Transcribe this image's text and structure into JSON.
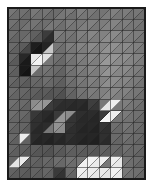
{
  "figure": {
    "type": "triangulated-grid-image",
    "background_color": "#ffffff",
    "grid_line_color": "#262626",
    "border_color": "#1a1a1a"
  },
  "chart_data": {
    "type": "heatmap",
    "subtitle": "",
    "xlabel": "",
    "ylabel": "",
    "grid": true,
    "legend": null,
    "colormap": "gray",
    "value_range": [
      0,
      255
    ],
    "layout": {
      "origin_x": 8,
      "origin_y": 8,
      "cell_width": 11.42,
      "cell_height": 11.4,
      "columns": 12,
      "rows": 15,
      "split": "anti-diagonal (bottom-left to top-right)",
      "triangles_per_cell": 2,
      "triangle_order": [
        "upper-left",
        "lower-right"
      ]
    },
    "note": "Each grid cell is bisected by a diagonal from its bottom-left corner to its top-right corner, producing an upper-left triangle and a lower-right triangle. Values below are 0-255 grayscale intensities, listed row by row (top to bottom), each cell as [upper_left, lower_right].",
    "cells": [
      [
        [
          118,
          108
        ],
        [
          112,
          104
        ],
        [
          120,
          112
        ],
        [
          116,
          106
        ],
        [
          108,
          118
        ],
        [
          122,
          110
        ],
        [
          126,
          118
        ],
        [
          120,
          112
        ],
        [
          116,
          124
        ],
        [
          128,
          118
        ],
        [
          124,
          114
        ],
        [
          118,
          110
        ]
      ],
      [
        [
          114,
          104
        ],
        [
          108,
          116
        ],
        [
          116,
          108
        ],
        [
          110,
          120
        ],
        [
          118,
          110
        ],
        [
          124,
          116
        ],
        [
          120,
          126
        ],
        [
          128,
          118
        ],
        [
          124,
          130
        ],
        [
          132,
          122
        ],
        [
          126,
          118
        ],
        [
          120,
          112
        ]
      ],
      [
        [
          110,
          100
        ],
        [
          104,
          112
        ],
        [
          96,
          86
        ],
        [
          60,
          44
        ],
        [
          126,
          116
        ],
        [
          120,
          112
        ],
        [
          128,
          120
        ],
        [
          134,
          124
        ],
        [
          130,
          140
        ],
        [
          138,
          128
        ],
        [
          132,
          124
        ],
        [
          124,
          116
        ]
      ],
      [
        [
          106,
          96
        ],
        [
          92,
          70
        ],
        [
          30,
          22
        ],
        [
          36,
          200
        ],
        [
          118,
          110
        ],
        [
          126,
          118
        ],
        [
          132,
          124
        ],
        [
          138,
          128
        ],
        [
          134,
          146
        ],
        [
          144,
          134
        ],
        [
          138,
          130
        ],
        [
          128,
          120
        ]
      ],
      [
        [
          102,
          90
        ],
        [
          40,
          26
        ],
        [
          232,
          244
        ],
        [
          226,
          118
        ],
        [
          112,
          104
        ],
        [
          122,
          114
        ],
        [
          128,
          122
        ],
        [
          136,
          126
        ],
        [
          140,
          152
        ],
        [
          148,
          138
        ],
        [
          142,
          132
        ],
        [
          130,
          122
        ]
      ],
      [
        [
          100,
          94
        ],
        [
          26,
          20
        ],
        [
          200,
          108
        ],
        [
          116,
          110
        ],
        [
          106,
          98
        ],
        [
          118,
          112
        ],
        [
          126,
          118
        ],
        [
          132,
          124
        ],
        [
          136,
          148
        ],
        [
          144,
          134
        ],
        [
          138,
          128
        ],
        [
          126,
          118
        ]
      ],
      [
        [
          104,
          96
        ],
        [
          98,
          90
        ],
        [
          104,
          100
        ],
        [
          110,
          104
        ],
        [
          100,
          94
        ],
        [
          114,
          108
        ],
        [
          122,
          116
        ],
        [
          128,
          120
        ],
        [
          132,
          142
        ],
        [
          140,
          130
        ],
        [
          134,
          124
        ],
        [
          122,
          114
        ]
      ],
      [
        [
          108,
          100
        ],
        [
          102,
          96
        ],
        [
          96,
          88
        ],
        [
          92,
          84
        ],
        [
          88,
          80
        ],
        [
          104,
          98
        ],
        [
          116,
          110
        ],
        [
          124,
          118
        ],
        [
          128,
          136
        ],
        [
          136,
          126
        ],
        [
          130,
          120
        ],
        [
          118,
          110
        ]
      ],
      [
        [
          112,
          104
        ],
        [
          106,
          98
        ],
        [
          140,
          150
        ],
        [
          150,
          60
        ],
        [
          52,
          44
        ],
        [
          46,
          40
        ],
        [
          44,
          38
        ],
        [
          62,
          54
        ],
        [
          120,
          230
        ],
        [
          238,
          120
        ],
        [
          126,
          118
        ],
        [
          116,
          108
        ]
      ],
      [
        [
          110,
          102
        ],
        [
          104,
          96
        ],
        [
          56,
          48
        ],
        [
          42,
          36
        ],
        [
          58,
          150
        ],
        [
          140,
          52
        ],
        [
          46,
          40
        ],
        [
          44,
          38
        ],
        [
          60,
          244
        ],
        [
          236,
          116
        ],
        [
          122,
          114
        ],
        [
          112,
          104
        ]
      ],
      [
        [
          106,
          98
        ],
        [
          100,
          92
        ],
        [
          48,
          40
        ],
        [
          44,
          120
        ],
        [
          146,
          140
        ],
        [
          54,
          46
        ],
        [
          42,
          36
        ],
        [
          40,
          34
        ],
        [
          52,
          46
        ],
        [
          110,
          104
        ],
        [
          118,
          110
        ],
        [
          110,
          102
        ]
      ],
      [
        [
          104,
          96
        ],
        [
          236,
          98
        ],
        [
          44,
          36
        ],
        [
          40,
          34
        ],
        [
          44,
          38
        ],
        [
          48,
          42
        ],
        [
          40,
          34
        ],
        [
          38,
          32
        ],
        [
          48,
          42
        ],
        [
          106,
          100
        ],
        [
          114,
          106
        ],
        [
          108,
          100
        ]
      ],
      [
        [
          102,
          94
        ],
        [
          96,
          90
        ],
        [
          92,
          86
        ],
        [
          88,
          82
        ],
        [
          94,
          88
        ],
        [
          100,
          94
        ],
        [
          96,
          90
        ],
        [
          92,
          86
        ],
        [
          98,
          92
        ],
        [
          104,
          98
        ],
        [
          112,
          104
        ],
        [
          106,
          98
        ]
      ],
      [
        [
          100,
          228
        ],
        [
          236,
          96
        ],
        [
          100,
          94
        ],
        [
          104,
          98
        ],
        [
          110,
          104
        ],
        [
          114,
          108
        ],
        [
          118,
          240
        ],
        [
          244,
          236
        ],
        [
          240,
          120
        ],
        [
          238,
          232
        ],
        [
          118,
          110
        ],
        [
          108,
          100
        ]
      ],
      [
        [
          98,
          92
        ],
        [
          94,
          88
        ],
        [
          98,
          92
        ],
        [
          102,
          96
        ],
        [
          58,
          50
        ],
        [
          106,
          100
        ],
        [
          240,
          234
        ],
        [
          238,
          232
        ],
        [
          236,
          230
        ],
        [
          242,
          236
        ],
        [
          120,
          112
        ],
        [
          110,
          102
        ]
      ]
    ]
  }
}
